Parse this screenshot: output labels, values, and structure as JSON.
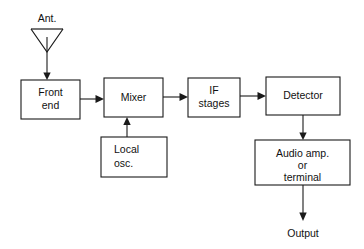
{
  "diagram": {
    "background_color": "#ffffff",
    "line_color": "#1a1a1a",
    "text_color": "#111111",
    "top_cut_text": "",
    "antenna": {
      "label": "Ant.",
      "symbol": "dipole-triangle-antenna"
    },
    "blocks": [
      {
        "id": "front_end",
        "line1": "Front",
        "line2": "end",
        "line3": ""
      },
      {
        "id": "mixer",
        "line1": "Mixer",
        "line2": "",
        "line3": ""
      },
      {
        "id": "if_stages",
        "line1": "IF",
        "line2": "stages",
        "line3": ""
      },
      {
        "id": "detector",
        "line1": "Detector",
        "line2": "",
        "line3": ""
      },
      {
        "id": "local_osc",
        "line1": "Local",
        "line2": "osc.",
        "line3": ""
      },
      {
        "id": "audio_amp",
        "line1": "Audio amp.",
        "line2": "or",
        "line3": "terminal"
      }
    ],
    "output_label": "Output",
    "signal_flow": [
      "Ant. -> Front end",
      "Front end -> Mixer",
      "Local osc. -> Mixer",
      "Mixer -> IF stages",
      "IF stages -> Detector",
      "Detector -> Audio amp. or terminal",
      "Audio amp. or terminal -> Output"
    ]
  }
}
